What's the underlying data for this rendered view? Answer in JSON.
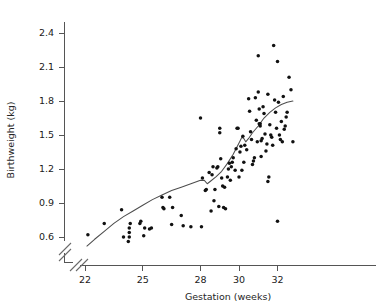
{
  "chart_data": {
    "type": "scatter",
    "title": "",
    "xlabel": "Gestation (weeks)",
    "ylabel": "Birthweight (kg)",
    "xlim": [
      21.6,
      33.2
    ],
    "ylim": [
      0.52,
      2.5
    ],
    "xticks": [
      22,
      25,
      28,
      30,
      32
    ],
    "xtick_labels": [
      "22",
      "25",
      "28",
      "30",
      "32"
    ],
    "yticks": [
      0.6,
      0.9,
      1.2,
      1.5,
      1.8,
      2.1,
      2.4
    ],
    "ytick_labels": [
      "0.6",
      "0.9",
      "1.2",
      "1.5",
      "1.8",
      "2.1",
      "2.4"
    ],
    "grid": false,
    "legend": null,
    "axis_break": {
      "x_axis": true,
      "y_axis": true,
      "note": "double slash break marks near origin on both axes"
    },
    "point_color": "#111111",
    "line_color": "#4d4d4d",
    "series": [
      {
        "name": "Births",
        "marker": "filled circle",
        "x": [
          22.15,
          23.0,
          23.9,
          24.0,
          24.25,
          24.3,
          24.3,
          24.3,
          24.35,
          24.85,
          24.9,
          25.05,
          25.1,
          25.35,
          25.45,
          26.0,
          26.05,
          26.1,
          26.4,
          26.5,
          26.55,
          27.0,
          27.1,
          27.5,
          28.0,
          28.05,
          28.1,
          28.25,
          28.3,
          28.45,
          28.55,
          28.6,
          28.65,
          28.7,
          28.75,
          28.85,
          28.9,
          28.95,
          29.0,
          29.0,
          29.05,
          29.1,
          29.15,
          29.2,
          29.25,
          29.3,
          29.4,
          29.45,
          29.5,
          29.55,
          29.6,
          29.65,
          29.7,
          29.8,
          29.85,
          29.9,
          29.95,
          30.0,
          30.05,
          30.1,
          30.15,
          30.2,
          30.25,
          30.3,
          30.4,
          30.5,
          30.55,
          30.6,
          30.65,
          30.7,
          30.75,
          30.8,
          30.85,
          30.9,
          30.95,
          31.0,
          31.0,
          31.05,
          31.05,
          31.1,
          31.1,
          31.15,
          31.15,
          31.2,
          31.25,
          31.3,
          31.35,
          31.4,
          31.45,
          31.5,
          31.5,
          31.55,
          31.6,
          31.65,
          31.7,
          31.75,
          31.8,
          31.85,
          31.9,
          31.95,
          32.0,
          32.0,
          32.05,
          32.1,
          32.15,
          32.2,
          32.25,
          32.3,
          32.35,
          32.4,
          32.45,
          32.5,
          32.6,
          32.7,
          32.8
        ],
        "y": [
          0.62,
          0.72,
          0.84,
          0.6,
          0.56,
          0.6,
          0.64,
          0.68,
          0.72,
          0.72,
          0.74,
          0.61,
          0.68,
          0.67,
          0.68,
          0.95,
          0.86,
          0.85,
          0.95,
          0.71,
          0.86,
          0.79,
          0.7,
          0.69,
          1.65,
          0.69,
          1.12,
          1.01,
          1.02,
          1.17,
          0.83,
          1.15,
          1.22,
          0.92,
          1.02,
          1.21,
          1.22,
          0.87,
          1.56,
          1.52,
          1.29,
          1.12,
          1.05,
          0.86,
          1.04,
          0.85,
          1.13,
          1.2,
          1.25,
          1.1,
          1.22,
          1.26,
          1.3,
          1.19,
          1.38,
          1.56,
          1.56,
          1.13,
          1.35,
          1.4,
          1.19,
          1.49,
          1.26,
          1.41,
          1.37,
          1.82,
          1.71,
          1.53,
          1.46,
          1.24,
          1.27,
          1.3,
          1.83,
          1.63,
          1.44,
          2.2,
          1.88,
          1.73,
          1.6,
          1.6,
          1.58,
          1.45,
          1.31,
          1.47,
          1.75,
          1.69,
          1.51,
          1.36,
          1.42,
          1.86,
          1.09,
          1.13,
          1.59,
          1.5,
          1.48,
          1.41,
          2.29,
          1.81,
          1.7,
          1.56,
          2.15,
          0.74,
          1.79,
          1.5,
          1.46,
          1.62,
          1.44,
          1.84,
          1.55,
          1.58,
          1.66,
          1.7,
          2.01,
          1.9,
          1.44
        ]
      }
    ],
    "trend": {
      "name": "smoothed fit",
      "x": [
        22.1,
        22.5,
        23.0,
        23.5,
        24.0,
        24.5,
        25.0,
        25.5,
        26.0,
        26.5,
        27.0,
        27.5,
        28.0,
        28.2,
        28.35,
        28.5,
        28.8,
        29.1,
        29.4,
        29.7,
        30.0,
        30.15,
        30.25,
        30.35,
        30.5,
        30.7,
        31.0,
        31.3,
        31.6,
        31.9,
        32.2,
        32.5,
        32.8
      ],
      "y": [
        0.52,
        0.58,
        0.65,
        0.72,
        0.78,
        0.83,
        0.88,
        0.93,
        0.97,
        1.01,
        1.04,
        1.07,
        1.1,
        1.1,
        1.07,
        1.09,
        1.13,
        1.18,
        1.25,
        1.33,
        1.43,
        1.48,
        1.47,
        1.44,
        1.47,
        1.52,
        1.58,
        1.65,
        1.7,
        1.74,
        1.77,
        1.79,
        1.8
      ]
    }
  }
}
